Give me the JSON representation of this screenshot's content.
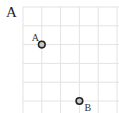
{
  "panel": {
    "label": "A"
  },
  "grid": {
    "origin_x": 23,
    "origin_y": 7,
    "spacing": 18.8,
    "cols": 5,
    "rows": 6,
    "line_color": "#e3e3e3"
  },
  "points": [
    {
      "label": "A",
      "col": 1,
      "row": 2,
      "label_dx": -10,
      "label_dy": -12
    },
    {
      "label": "B",
      "col": 3,
      "row": 5,
      "label_dx": 5,
      "label_dy": 2
    }
  ],
  "colors": {
    "point_fill": "#c8c8c8",
    "point_stroke": "#222222"
  }
}
